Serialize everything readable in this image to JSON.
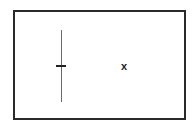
{
  "diagram": {
    "marker_label": "x",
    "colors": {
      "border": "#2a2a2a",
      "line": "#6a6a6a",
      "tick": "#222222",
      "background": "#ffffff"
    }
  }
}
